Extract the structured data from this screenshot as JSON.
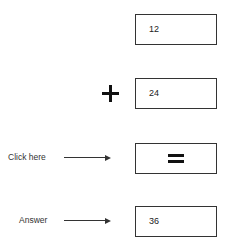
{
  "calculator": {
    "first_operand": "12",
    "operator_symbol": "+",
    "second_operand": "24",
    "equals_button_label": "=",
    "result": "36"
  },
  "annotations": {
    "click_label": "Click here",
    "answer_label": "Answer"
  },
  "icons": {
    "operator": "plus-icon",
    "equals": "equals-icon",
    "arrows": "arrow-right-icon"
  }
}
